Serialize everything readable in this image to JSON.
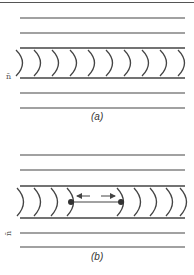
{
  "figure": {
    "line_color": "#444444",
    "panels": [
      {
        "id": "a",
        "caption": "(a)",
        "side_label": "n̄",
        "lines_y": [
          18,
          33,
          48,
          78,
          93,
          108
        ],
        "channel": {
          "top": 48,
          "bottom": 78
        },
        "arcs_x": [
          20,
          38,
          56,
          74,
          92,
          110,
          128,
          146,
          164,
          182
        ]
      },
      {
        "id": "b",
        "caption": "(b)",
        "side_label": "n̄",
        "lines_y": [
          155,
          170,
          186,
          218,
          233,
          247
        ],
        "channel": {
          "top": 186,
          "bottom": 218
        },
        "arcs_x_left": [
          21,
          38,
          55,
          71
        ],
        "arcs_x_right": [
          121,
          138,
          154,
          170,
          184
        ],
        "dots": [
          {
            "x": 71,
            "y": 202
          },
          {
            "x": 121,
            "y": 202
          }
        ],
        "arrows": [
          {
            "direction": "left",
            "x1": 90,
            "x2": 77,
            "y": 196
          },
          {
            "direction": "right",
            "x1": 101,
            "x2": 115,
            "y": 196
          }
        ]
      }
    ]
  }
}
